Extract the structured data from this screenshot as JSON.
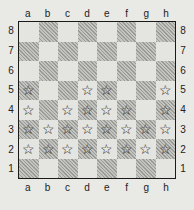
{
  "board": {
    "files": [
      "a",
      "b",
      "c",
      "d",
      "e",
      "f",
      "g",
      "h"
    ],
    "ranks": [
      "8",
      "7",
      "6",
      "5",
      "4",
      "3",
      "2",
      "1"
    ],
    "bottom_left_square_color": "dark",
    "marker_icon": "star-outline-icon",
    "marker_glyph": "☆",
    "marked_squares": [
      "a5",
      "d5",
      "e5",
      "h5",
      "a4",
      "c4",
      "d4",
      "e4",
      "f4",
      "h4",
      "a3",
      "b3",
      "c3",
      "d3",
      "e3",
      "f3",
      "g3",
      "h3",
      "a2",
      "b2",
      "c2",
      "d2",
      "e2",
      "f2",
      "g2",
      "h2"
    ],
    "colors": {
      "light_square": "#e4e4e0",
      "dark_square": "#b8b8b4",
      "border": "#1a1a1a",
      "marker": "#1a1a1a"
    }
  }
}
